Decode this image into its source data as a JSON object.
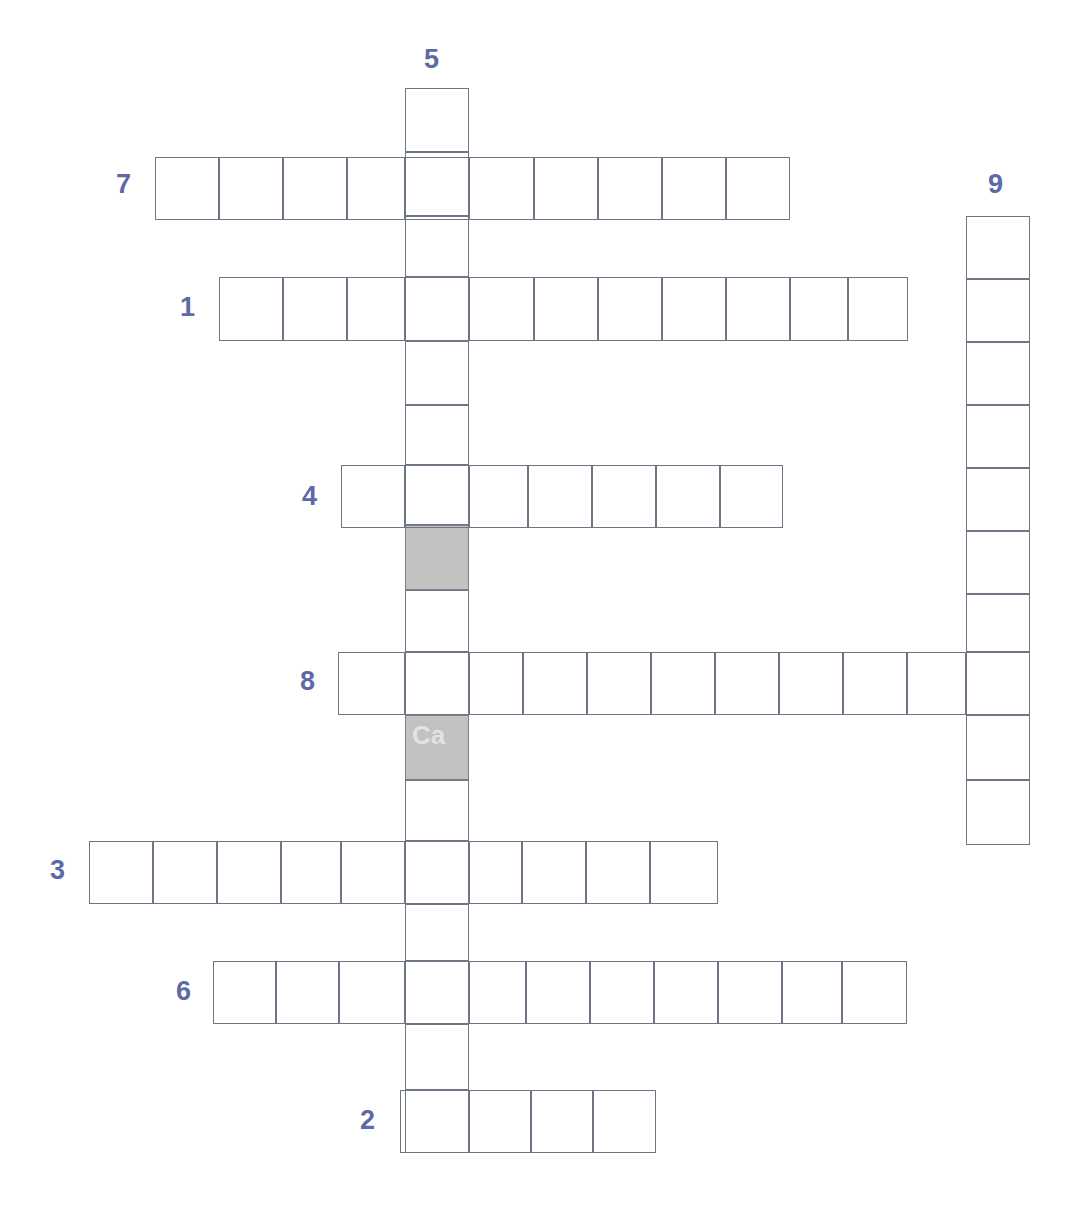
{
  "puzzle": {
    "title": "Crossword Grid",
    "cell_size": 64,
    "line_color": "#6e7584",
    "number_color": "#5e6aa6",
    "shaded_color": "#c2c2c2",
    "background_color": "#ffffff"
  },
  "numbers": [
    {
      "id": "5",
      "label": "5",
      "x": 424,
      "y": 46,
      "direction": "down"
    },
    {
      "id": "7",
      "label": "7",
      "x": 116,
      "y": 171,
      "direction": "across"
    },
    {
      "id": "9",
      "label": "9",
      "x": 988,
      "y": 171,
      "direction": "down"
    },
    {
      "id": "1",
      "label": "1",
      "x": 180,
      "y": 294,
      "direction": "across"
    },
    {
      "id": "4",
      "label": "4",
      "x": 302,
      "y": 483,
      "direction": "across"
    },
    {
      "id": "8",
      "label": "8",
      "x": 300,
      "y": 668,
      "direction": "across"
    },
    {
      "id": "3",
      "label": "3",
      "x": 50,
      "y": 857,
      "direction": "across"
    },
    {
      "id": "6",
      "label": "6",
      "x": 176,
      "y": 978,
      "direction": "across"
    },
    {
      "id": "2",
      "label": "2",
      "x": 360,
      "y": 1107,
      "direction": "across"
    }
  ],
  "entries": [
    {
      "id": "entry-5-down",
      "number": "5",
      "direction": "down",
      "length": 17,
      "origin_x": 405,
      "origin_y": 88,
      "cells": [
        {
          "x": 405,
          "y": 88,
          "w": 64,
          "h": 64,
          "shaded": false
        },
        {
          "x": 405,
          "y": 152,
          "w": 64,
          "h": 64,
          "shaded": false
        },
        {
          "x": 405,
          "y": 216,
          "w": 64,
          "h": 61,
          "shaded": false
        },
        {
          "x": 405,
          "y": 277,
          "w": 64,
          "h": 64,
          "shaded": false
        },
        {
          "x": 405,
          "y": 341,
          "w": 64,
          "h": 64,
          "shaded": false
        },
        {
          "x": 405,
          "y": 405,
          "w": 64,
          "h": 60,
          "shaded": false
        },
        {
          "x": 405,
          "y": 465,
          "w": 64,
          "h": 60,
          "shaded": false
        },
        {
          "x": 405,
          "y": 525,
          "w": 64,
          "h": 65,
          "shaded": true
        },
        {
          "x": 405,
          "y": 590,
          "w": 64,
          "h": 62,
          "shaded": false
        },
        {
          "x": 405,
          "y": 652,
          "w": 64,
          "h": 63,
          "shaded": false
        },
        {
          "x": 405,
          "y": 715,
          "w": 64,
          "h": 65,
          "shaded": true
        },
        {
          "x": 405,
          "y": 780,
          "w": 64,
          "h": 61,
          "shaded": false
        },
        {
          "x": 405,
          "y": 841,
          "w": 64,
          "h": 63,
          "shaded": false
        },
        {
          "x": 405,
          "y": 904,
          "w": 64,
          "h": 57,
          "shaded": false
        },
        {
          "x": 405,
          "y": 961,
          "w": 64,
          "h": 63,
          "shaded": false
        },
        {
          "x": 405,
          "y": 1024,
          "w": 64,
          "h": 66,
          "shaded": false
        },
        {
          "x": 405,
          "y": 1090,
          "w": 64,
          "h": 63,
          "shaded": false
        }
      ]
    },
    {
      "id": "entry-7-across",
      "number": "7",
      "direction": "across",
      "length": 10,
      "origin_x": 155,
      "origin_y": 157,
      "cells": [
        {
          "x": 155,
          "y": 157,
          "w": 64,
          "h": 63,
          "shaded": false
        },
        {
          "x": 219,
          "y": 157,
          "w": 64,
          "h": 63,
          "shaded": false
        },
        {
          "x": 283,
          "y": 157,
          "w": 64,
          "h": 63,
          "shaded": false
        },
        {
          "x": 347,
          "y": 157,
          "w": 58,
          "h": 63,
          "shaded": false
        },
        {
          "x": 405,
          "y": 157,
          "w": 64,
          "h": 63,
          "shaded": false
        },
        {
          "x": 469,
          "y": 157,
          "w": 65,
          "h": 63,
          "shaded": false
        },
        {
          "x": 534,
          "y": 157,
          "w": 64,
          "h": 63,
          "shaded": false
        },
        {
          "x": 598,
          "y": 157,
          "w": 64,
          "h": 63,
          "shaded": false
        },
        {
          "x": 662,
          "y": 157,
          "w": 64,
          "h": 63,
          "shaded": false
        },
        {
          "x": 726,
          "y": 157,
          "w": 64,
          "h": 63,
          "shaded": false
        }
      ]
    },
    {
      "id": "entry-1-across",
      "number": "1",
      "direction": "across",
      "length": 11,
      "origin_x": 219,
      "origin_y": 277,
      "cells": [
        {
          "x": 219,
          "y": 277,
          "w": 64,
          "h": 64,
          "shaded": false
        },
        {
          "x": 283,
          "y": 277,
          "w": 64,
          "h": 64,
          "shaded": false
        },
        {
          "x": 347,
          "y": 277,
          "w": 58,
          "h": 64,
          "shaded": false
        },
        {
          "x": 405,
          "y": 277,
          "w": 64,
          "h": 64,
          "shaded": false
        },
        {
          "x": 469,
          "y": 277,
          "w": 65,
          "h": 64,
          "shaded": false
        },
        {
          "x": 534,
          "y": 277,
          "w": 64,
          "h": 64,
          "shaded": false
        },
        {
          "x": 598,
          "y": 277,
          "w": 64,
          "h": 64,
          "shaded": false
        },
        {
          "x": 662,
          "y": 277,
          "w": 64,
          "h": 64,
          "shaded": false
        },
        {
          "x": 726,
          "y": 277,
          "w": 64,
          "h": 64,
          "shaded": false
        },
        {
          "x": 790,
          "y": 277,
          "w": 58,
          "h": 64,
          "shaded": false
        },
        {
          "x": 848,
          "y": 277,
          "w": 60,
          "h": 64,
          "shaded": false
        }
      ]
    },
    {
      "id": "entry-4-across",
      "number": "4",
      "direction": "across",
      "length": 7,
      "origin_x": 341,
      "origin_y": 465,
      "cells": [
        {
          "x": 341,
          "y": 465,
          "w": 64,
          "h": 63,
          "shaded": false
        },
        {
          "x": 405,
          "y": 465,
          "w": 64,
          "h": 63,
          "shaded": false
        },
        {
          "x": 469,
          "y": 465,
          "w": 59,
          "h": 63,
          "shaded": false
        },
        {
          "x": 528,
          "y": 465,
          "w": 64,
          "h": 63,
          "shaded": false
        },
        {
          "x": 592,
          "y": 465,
          "w": 64,
          "h": 63,
          "shaded": false
        },
        {
          "x": 656,
          "y": 465,
          "w": 64,
          "h": 63,
          "shaded": false
        },
        {
          "x": 720,
          "y": 465,
          "w": 63,
          "h": 63,
          "shaded": false
        }
      ]
    },
    {
      "id": "entry-8-across",
      "number": "8",
      "direction": "across",
      "length": 11,
      "origin_x": 338,
      "origin_y": 652,
      "cells": [
        {
          "x": 338,
          "y": 652,
          "w": 67,
          "h": 63,
          "shaded": false
        },
        {
          "x": 405,
          "y": 652,
          "w": 64,
          "h": 63,
          "shaded": false
        },
        {
          "x": 469,
          "y": 652,
          "w": 54,
          "h": 63,
          "shaded": false
        },
        {
          "x": 523,
          "y": 652,
          "w": 64,
          "h": 63,
          "shaded": false
        },
        {
          "x": 587,
          "y": 652,
          "w": 64,
          "h": 63,
          "shaded": false
        },
        {
          "x": 651,
          "y": 652,
          "w": 64,
          "h": 63,
          "shaded": false
        },
        {
          "x": 715,
          "y": 652,
          "w": 64,
          "h": 63,
          "shaded": false
        },
        {
          "x": 779,
          "y": 652,
          "w": 64,
          "h": 63,
          "shaded": false
        },
        {
          "x": 843,
          "y": 652,
          "w": 64,
          "h": 63,
          "shaded": false
        },
        {
          "x": 907,
          "y": 652,
          "w": 59,
          "h": 63,
          "shaded": false
        },
        {
          "x": 966,
          "y": 652,
          "w": 64,
          "h": 63,
          "shaded": false
        }
      ]
    },
    {
      "id": "entry-3-across",
      "number": "3",
      "direction": "across",
      "length": 10,
      "origin_x": 89,
      "origin_y": 841,
      "cells": [
        {
          "x": 89,
          "y": 841,
          "w": 64,
          "h": 63,
          "shaded": false
        },
        {
          "x": 153,
          "y": 841,
          "w": 64,
          "h": 63,
          "shaded": false
        },
        {
          "x": 217,
          "y": 841,
          "w": 64,
          "h": 63,
          "shaded": false
        },
        {
          "x": 281,
          "y": 841,
          "w": 60,
          "h": 63,
          "shaded": false
        },
        {
          "x": 341,
          "y": 841,
          "w": 64,
          "h": 63,
          "shaded": false
        },
        {
          "x": 405,
          "y": 841,
          "w": 64,
          "h": 63,
          "shaded": false
        },
        {
          "x": 469,
          "y": 841,
          "w": 53,
          "h": 63,
          "shaded": false
        },
        {
          "x": 522,
          "y": 841,
          "w": 64,
          "h": 63,
          "shaded": false
        },
        {
          "x": 586,
          "y": 841,
          "w": 64,
          "h": 63,
          "shaded": false
        },
        {
          "x": 650,
          "y": 841,
          "w": 68,
          "h": 63,
          "shaded": false
        }
      ]
    },
    {
      "id": "entry-6-across",
      "number": "6",
      "direction": "across",
      "length": 11,
      "origin_x": 213,
      "origin_y": 961,
      "cells": [
        {
          "x": 213,
          "y": 961,
          "w": 63,
          "h": 63,
          "shaded": false
        },
        {
          "x": 276,
          "y": 961,
          "w": 63,
          "h": 63,
          "shaded": false
        },
        {
          "x": 339,
          "y": 961,
          "w": 66,
          "h": 63,
          "shaded": false
        },
        {
          "x": 405,
          "y": 961,
          "w": 64,
          "h": 63,
          "shaded": false
        },
        {
          "x": 469,
          "y": 961,
          "w": 57,
          "h": 63,
          "shaded": false
        },
        {
          "x": 526,
          "y": 961,
          "w": 64,
          "h": 63,
          "shaded": false
        },
        {
          "x": 590,
          "y": 961,
          "w": 64,
          "h": 63,
          "shaded": false
        },
        {
          "x": 654,
          "y": 961,
          "w": 64,
          "h": 63,
          "shaded": false
        },
        {
          "x": 718,
          "y": 961,
          "w": 64,
          "h": 63,
          "shaded": false
        },
        {
          "x": 782,
          "y": 961,
          "w": 60,
          "h": 63,
          "shaded": false
        },
        {
          "x": 842,
          "y": 961,
          "w": 65,
          "h": 63,
          "shaded": false
        }
      ]
    },
    {
      "id": "entry-2-across",
      "number": "2",
      "direction": "across",
      "length": 4,
      "origin_x": 400,
      "origin_y": 1090,
      "cells": [
        {
          "x": 400,
          "y": 1090,
          "w": 69,
          "h": 63,
          "shaded": false
        },
        {
          "x": 469,
          "y": 1090,
          "w": 62,
          "h": 63,
          "shaded": false
        },
        {
          "x": 531,
          "y": 1090,
          "w": 62,
          "h": 63,
          "shaded": false
        },
        {
          "x": 593,
          "y": 1090,
          "w": 63,
          "h": 63,
          "shaded": false
        }
      ]
    },
    {
      "id": "entry-9-down",
      "number": "9",
      "direction": "down",
      "length": 10,
      "origin_x": 966,
      "origin_y": 216,
      "cells": [
        {
          "x": 966,
          "y": 216,
          "w": 64,
          "h": 63,
          "shaded": false
        },
        {
          "x": 966,
          "y": 279,
          "w": 64,
          "h": 63,
          "shaded": false
        },
        {
          "x": 966,
          "y": 342,
          "w": 64,
          "h": 63,
          "shaded": false
        },
        {
          "x": 966,
          "y": 405,
          "w": 64,
          "h": 63,
          "shaded": false
        },
        {
          "x": 966,
          "y": 468,
          "w": 64,
          "h": 63,
          "shaded": false
        },
        {
          "x": 966,
          "y": 531,
          "w": 64,
          "h": 63,
          "shaded": false
        },
        {
          "x": 966,
          "y": 594,
          "w": 64,
          "h": 58,
          "shaded": false
        },
        {
          "x": 966,
          "y": 652,
          "w": 64,
          "h": 63,
          "shaded": false
        },
        {
          "x": 966,
          "y": 715,
          "w": 64,
          "h": 65,
          "shaded": false
        },
        {
          "x": 966,
          "y": 780,
          "w": 64,
          "h": 65,
          "shaded": false
        }
      ]
    }
  ],
  "watermarks": [
    {
      "text": "Ca",
      "x": 412,
      "y": 722
    }
  ]
}
